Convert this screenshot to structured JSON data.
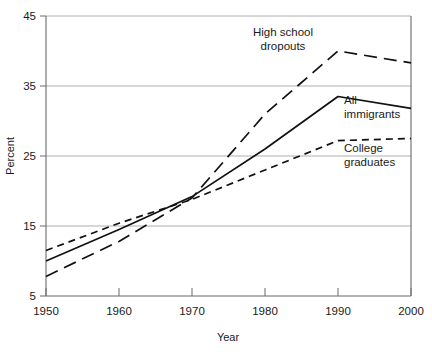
{
  "chart_data": {
    "type": "line",
    "title": "",
    "xlabel": "Year",
    "ylabel": "Percent",
    "x": [
      1950,
      1960,
      1970,
      1980,
      1990,
      2000
    ],
    "xlim": [
      1950,
      2000
    ],
    "ylim": [
      5,
      45
    ],
    "xticks": [
      "1950",
      "1960",
      "1970",
      "1980",
      "1990",
      "2000"
    ],
    "yticks": [
      "5",
      "15",
      "25",
      "35",
      "45"
    ],
    "grid": "horizontal",
    "legend_position": "inline-annotations",
    "series": [
      {
        "name": "High school dropouts",
        "style": "long-dash",
        "values": [
          7.8,
          12.8,
          19.0,
          31.0,
          40.0,
          38.3
        ]
      },
      {
        "name": "All immigrants",
        "style": "solid",
        "values": [
          10.0,
          14.5,
          19.2,
          26.0,
          33.5,
          31.8
        ]
      },
      {
        "name": "College graduates",
        "style": "short-dash",
        "values": [
          11.5,
          15.4,
          18.8,
          23.0,
          27.2,
          27.5
        ]
      }
    ],
    "annotations": [
      {
        "text_line1": "High school",
        "text_line2": "dropouts",
        "for_series": "High school dropouts"
      },
      {
        "text_line1": "All",
        "text_line2": "immigrants",
        "for_series": "All immigrants"
      },
      {
        "text_line1": "College",
        "text_line2": "graduates",
        "for_series": "College graduates"
      }
    ]
  },
  "axis": {
    "y_title": "Percent",
    "x_title": "Year",
    "y_tick_0": "5",
    "y_tick_1": "15",
    "y_tick_2": "25",
    "y_tick_3": "35",
    "y_tick_4": "45",
    "x_tick_0": "1950",
    "x_tick_1": "1960",
    "x_tick_2": "1970",
    "x_tick_3": "1980",
    "x_tick_4": "1990",
    "x_tick_5": "2000"
  },
  "labels": {
    "dropouts_1": "High school",
    "dropouts_2": "dropouts",
    "immigrants_1": "All",
    "immigrants_2": "immigrants",
    "college_1": "College",
    "college_2": "graduates"
  },
  "colors": {
    "line": "#111111",
    "grid": "#9a9a9a",
    "axis": "#6b6b6b",
    "background": "#ffffff"
  }
}
